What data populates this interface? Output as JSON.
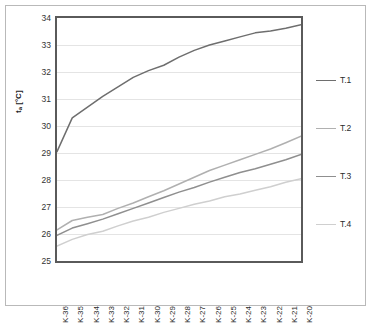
{
  "chart_data": {
    "type": "line",
    "title": "",
    "xlabel": "",
    "ylabel": "tₐ [°C]",
    "ylabel_base": "t",
    "ylabel_sub": "a",
    "ylabel_unit": " [°C]",
    "ylim": [
      25,
      34
    ],
    "yticks": [
      25,
      26,
      27,
      28,
      29,
      30,
      31,
      32,
      33,
      34
    ],
    "ytick_labels": [
      "25",
      "26",
      "27",
      "28",
      "29",
      "30",
      "31",
      "32",
      "33",
      "34"
    ],
    "grid": true,
    "grid_axis": "y",
    "legend_position": "right",
    "categories": [
      "K-36",
      "K-35",
      "K-34",
      "K-33",
      "K-32",
      "K-31",
      "K-30",
      "K-29",
      "K-28",
      "K-27",
      "K-26",
      "K-25",
      "K-24",
      "K-23",
      "K-22",
      "K-21",
      "K-20"
    ],
    "series": [
      {
        "name": "T.1",
        "color": "#6e6e6e",
        "values": [
          29.05,
          30.3,
          30.7,
          31.1,
          31.45,
          31.8,
          32.05,
          32.25,
          32.55,
          32.8,
          33.0,
          33.15,
          33.3,
          33.45,
          33.52,
          33.62,
          33.75
        ]
      },
      {
        "name": "T.2",
        "color": "#b0b0b0",
        "values": [
          26.15,
          26.5,
          26.62,
          26.72,
          26.95,
          27.15,
          27.38,
          27.6,
          27.85,
          28.1,
          28.35,
          28.55,
          28.75,
          28.95,
          29.15,
          29.38,
          29.62
        ]
      },
      {
        "name": "T.3",
        "color": "#8f8f8f",
        "values": [
          25.95,
          26.22,
          26.38,
          26.55,
          26.75,
          26.95,
          27.15,
          27.35,
          27.55,
          27.72,
          27.92,
          28.1,
          28.28,
          28.42,
          28.58,
          28.75,
          28.95
        ]
      },
      {
        "name": "T.4",
        "color": "#cfcfcf",
        "values": [
          25.55,
          25.8,
          25.98,
          26.1,
          26.3,
          26.48,
          26.62,
          26.8,
          26.95,
          27.1,
          27.22,
          27.38,
          27.48,
          27.62,
          27.75,
          27.92,
          28.05
        ]
      }
    ]
  },
  "legend": {
    "items": [
      {
        "label": "T.1",
        "color": "#6e6e6e"
      },
      {
        "label": "T.2",
        "color": "#b0b0b0"
      },
      {
        "label": "T.3",
        "color": "#8f8f8f"
      },
      {
        "label": "T.4",
        "color": "#cfcfcf"
      }
    ]
  },
  "style": {
    "plot_border_color": "#5a5a5a",
    "outer_border_color": "#b9b9b9",
    "gridline_color": "#e4e4e4",
    "background": "#ffffff",
    "tick_text_color": "#2b2b2b"
  }
}
